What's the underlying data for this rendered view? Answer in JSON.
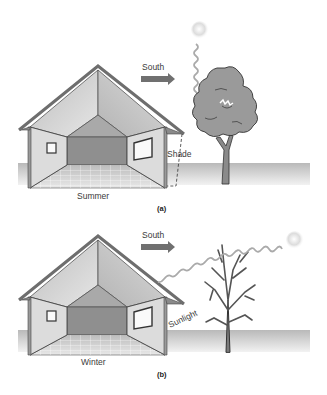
{
  "figure": {
    "panels": [
      {
        "id": "a",
        "caption": "(a)",
        "season_label": "Summer",
        "direction_label": "South",
        "light_label": "Shade",
        "tree_state": "leafy",
        "sun_position": "high"
      },
      {
        "id": "b",
        "caption": "(b)",
        "season_label": "Winter",
        "direction_label": "South",
        "light_label": "Sunlight",
        "tree_state": "bare",
        "sun_position": "low"
      }
    ]
  },
  "colors": {
    "roof": "#6e6e6e",
    "ceiling": "#d2d2d2",
    "back_wall": "#8f8f8f",
    "side_wall": "#d9d9d9",
    "ground": "#c8c8c8",
    "tree": "#8a8a8a",
    "arrow": "#707070",
    "sun": "#e0e0e0"
  }
}
